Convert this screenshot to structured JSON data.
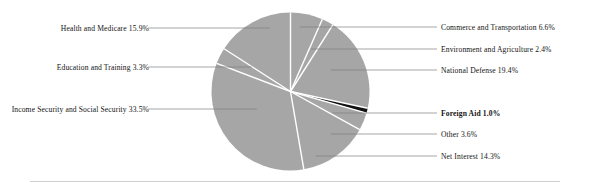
{
  "chart_data": {
    "type": "pie",
    "title": "",
    "subtitle": "",
    "xlabel": "",
    "ylabel": "",
    "legend_position": "callout-labels",
    "grid": false,
    "start_angle_deg": 0,
    "direction": "clockwise",
    "units": "percent",
    "total": 100.0,
    "categories": [
      "Commerce and Transportation",
      "Environment and Agriculture",
      "National Defense",
      "Foreign Aid",
      "Other",
      "Net Interest",
      "Income Security and Social Security",
      "Education and Training",
      "Health and Medicare"
    ],
    "values": [
      6.6,
      2.4,
      19.4,
      1.0,
      3.6,
      14.3,
      33.5,
      3.3,
      15.9
    ],
    "slices": [
      {
        "name": "Commerce and Transportation",
        "value": 6.6,
        "label": "Commerce and Transportation 6.6%",
        "color": "#a6a6a6",
        "emphasis": false,
        "side": "right"
      },
      {
        "name": "Environment and Agriculture",
        "value": 2.4,
        "label": "Environment and Agriculture 2.4%",
        "color": "#a6a6a6",
        "emphasis": false,
        "side": "right"
      },
      {
        "name": "National Defense",
        "value": 19.4,
        "label": "National Defense 19.4%",
        "color": "#a6a6a6",
        "emphasis": false,
        "side": "right"
      },
      {
        "name": "Foreign Aid",
        "value": 1.0,
        "label": "Foreign Aid 1.0%",
        "color": "#111111",
        "emphasis": true,
        "side": "right"
      },
      {
        "name": "Other",
        "value": 3.6,
        "label": "Other 3.6%",
        "color": "#a6a6a6",
        "emphasis": false,
        "side": "right"
      },
      {
        "name": "Net Interest",
        "value": 14.3,
        "label": "Net Interest 14.3%",
        "color": "#a6a6a6",
        "emphasis": false,
        "side": "right"
      },
      {
        "name": "Income Security and Social Security",
        "value": 33.5,
        "label": "Income Security and Social Security 33.5%",
        "color": "#a6a6a6",
        "emphasis": false,
        "side": "left"
      },
      {
        "name": "Education and Training",
        "value": 3.3,
        "label": "Education and Training 3.3%",
        "color": "#a6a6a6",
        "emphasis": false,
        "side": "left"
      },
      {
        "name": "Health and Medicare",
        "value": 15.9,
        "label": "Health and Medicare 15.9%",
        "color": "#a6a6a6",
        "emphasis": false,
        "side": "left"
      }
    ],
    "colors": {
      "slice_fill": "#a6a6a6",
      "slice_highlight": "#111111",
      "slice_divider": "#ffffff",
      "leader_line": "#808080",
      "footer_rule": "#cfcfcf",
      "label_text": "#141414",
      "background": "#ffffff"
    }
  }
}
